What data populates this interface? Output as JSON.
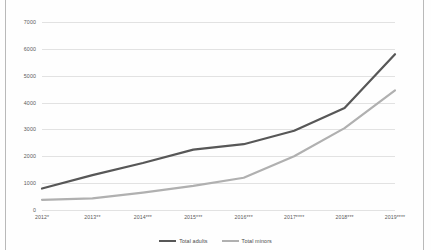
{
  "chart_data": {
    "type": "line",
    "title": "",
    "xlabel": "",
    "ylabel": "",
    "ylim": [
      0,
      7000
    ],
    "ytick_values": [
      0,
      1000,
      2000,
      3000,
      4000,
      5000,
      6000,
      7000
    ],
    "ytick_labels": [
      "0",
      "1000",
      "2000",
      "3000",
      "4000",
      "5000",
      "6000",
      "7000"
    ],
    "grid": true,
    "legend_position": "bottom",
    "categories": [
      "2012*",
      "2013**",
      "2014***",
      "2015***",
      "2016***",
      "2017****",
      "2018***",
      "2019****"
    ],
    "series": [
      {
        "name": "Total adults",
        "color": "#575757",
        "values": [
          800,
          1300,
          1750,
          2250,
          2450,
          2950,
          3800,
          5800
        ]
      },
      {
        "name": "Total minors",
        "color": "#b0b0b0",
        "values": [
          380,
          430,
          650,
          900,
          1200,
          2000,
          3050,
          4450
        ]
      }
    ]
  },
  "legend": {
    "entries": [
      {
        "label": "Total adults",
        "color": "#575757"
      },
      {
        "label": "Total minors",
        "color": "#b0b0b0"
      }
    ]
  },
  "colors": {
    "adults": "#575757",
    "minors": "#b0b0b0",
    "gridline": "#e2e2e2",
    "axis_text": "#5a5a5a",
    "frame": "#b9b9b9",
    "background": "#fefefe"
  }
}
